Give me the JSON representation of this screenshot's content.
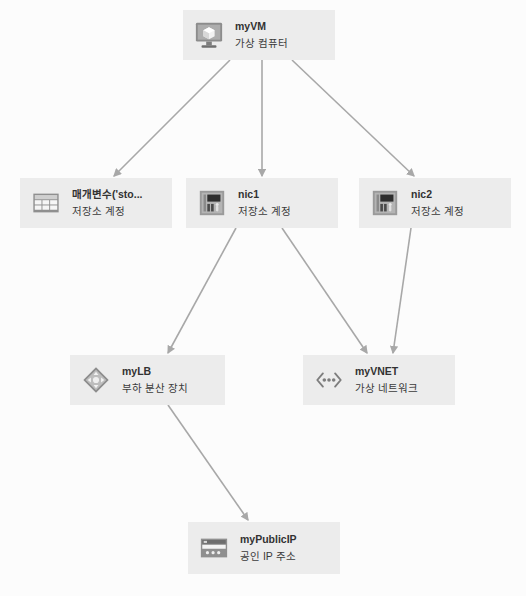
{
  "diagram": {
    "background_color": "#fcfcfc",
    "node_fill_color": "#ececec",
    "edge_color": "#a8a8a8",
    "nodes": [
      {
        "id": "myVM",
        "title": "myVM",
        "subtitle": "가상 컴퓨터",
        "icon": "virtual-machine-icon",
        "x": 183,
        "y": 10,
        "w": 152,
        "h": 50
      },
      {
        "id": "storageParam",
        "title": "매개변수('sto...",
        "subtitle": "저장소 계정",
        "icon": "storage-table-icon",
        "x": 20,
        "y": 178,
        "w": 152,
        "h": 50
      },
      {
        "id": "nic1",
        "title": "nic1",
        "subtitle": "저장소 계정",
        "icon": "network-interface-icon",
        "x": 186,
        "y": 178,
        "w": 152,
        "h": 50
      },
      {
        "id": "nic2",
        "title": "nic2",
        "subtitle": "저장소 계정",
        "icon": "network-interface-icon",
        "x": 359,
        "y": 178,
        "w": 152,
        "h": 50
      },
      {
        "id": "myLB",
        "title": "myLB",
        "subtitle": "부하 분산 장치",
        "icon": "load-balancer-icon",
        "x": 70,
        "y": 355,
        "w": 155,
        "h": 50
      },
      {
        "id": "myVNET",
        "title": "myVNET",
        "subtitle": "가상 네트워크",
        "icon": "virtual-network-icon",
        "x": 303,
        "y": 355,
        "w": 152,
        "h": 50
      },
      {
        "id": "myPublicIP",
        "title": "myPublicIP",
        "subtitle": "공인 IP 주소",
        "icon": "public-ip-icon",
        "x": 188,
        "y": 522,
        "w": 152,
        "h": 52
      }
    ],
    "edges": [
      {
        "from": "myVM",
        "to": "storageParam",
        "x1": 230,
        "y1": 60,
        "x2": 114,
        "y2": 176
      },
      {
        "from": "myVM",
        "to": "nic1",
        "x1": 262,
        "y1": 60,
        "x2": 262,
        "y2": 176
      },
      {
        "from": "myVM",
        "to": "nic2",
        "x1": 292,
        "y1": 60,
        "x2": 414,
        "y2": 176
      },
      {
        "from": "nic1",
        "to": "myLB",
        "x1": 236,
        "y1": 228,
        "x2": 168,
        "y2": 353
      },
      {
        "from": "nic1",
        "to": "myVNET",
        "x1": 282,
        "y1": 228,
        "x2": 367,
        "y2": 353
      },
      {
        "from": "nic2",
        "to": "myVNET",
        "x1": 411,
        "y1": 228,
        "x2": 393,
        "y2": 353
      },
      {
        "from": "myLB",
        "to": "myPublicIP",
        "x1": 168,
        "y1": 405,
        "x2": 248,
        "y2": 520
      }
    ]
  }
}
